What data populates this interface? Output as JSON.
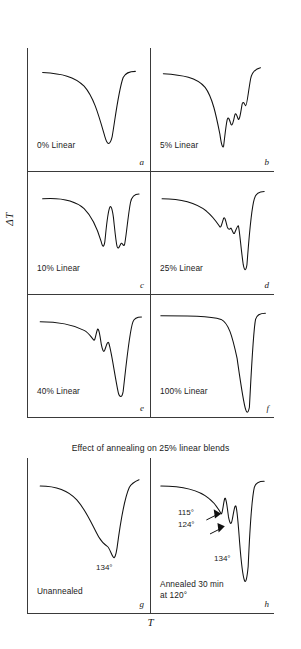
{
  "figure": {
    "y_axis_label": "ΔT",
    "x_axis_label": "T",
    "caption_bottom": "Effect of annealing on 25% linear blends"
  },
  "panels": [
    {
      "id": "a",
      "label": "0% Linear",
      "letter": "a"
    },
    {
      "id": "b",
      "label": "5% Linear",
      "letter": "b"
    },
    {
      "id": "c",
      "label": "10% Linear",
      "letter": "c"
    },
    {
      "id": "d",
      "label": "25% Linear",
      "letter": "d"
    },
    {
      "id": "e",
      "label": "40% Linear",
      "letter": "e"
    },
    {
      "id": "f",
      "label": "100% Linear",
      "letter": "f"
    },
    {
      "id": "g",
      "label": "Unannealed",
      "letter": "g"
    },
    {
      "id": "h",
      "label": "Annealed 30 min\nat 120°",
      "letter": "h"
    }
  ],
  "annotations": {
    "g_peak": "134°",
    "h_peak1": "115°",
    "h_peak2": "124°",
    "h_peak3": "134°"
  },
  "chart_data": {
    "type": "line",
    "xlabel": "T",
    "ylabel": "ΔT",
    "grid": false,
    "legend": "none",
    "note": "Eight thermal-analysis traces. Baseline runs flat at top; endothermic melting peaks deflect downward. Curves are traced paths in panel-local coordinates (0-100 x, 0-100 y, y increasing downward).",
    "series": [
      {
        "name": "0% Linear",
        "panel": "a",
        "peaks": [
          {
            "position": 66,
            "depth": 78,
            "label": null
          }
        ],
        "path": "M 12,20 C 28,21 38,23 46,31 C 54,40 58,55 63,72 C 65,79 67,80 69,72 C 71,61 74,35 78,24 C 80,20 84,19 88,19"
      },
      {
        "name": "5% Linear",
        "panel": "b",
        "peaks": [
          {
            "position": 57,
            "depth": 80,
            "label": null
          },
          {
            "position": 68,
            "depth": 55,
            "label": null
          },
          {
            "position": 76,
            "depth": 45,
            "label": null
          }
        ],
        "path": "M 10,21 C 26,22 37,24 44,32 C 50,40 53,55 56,70 C 57,77 58,82 59,80 C 60,72 61,62 62,58 C 63,55 64,59 65,62 C 66,64 67,60 68,55 C 69,51 70,56 71,58 C 72,59 73,52 74,46 C 75,42 76,46 77,47 C 78,47 79,36 81,25 C 82,20 85,17 89,16"
      },
      {
        "name": "10% Linear",
        "panel": "c",
        "peaks": [
          {
            "position": 61,
            "depth": 62,
            "label": null
          },
          {
            "position": 73,
            "depth": 63,
            "label": null
          }
        ],
        "path": "M 12,22 C 26,21 38,23 46,30 C 53,37 57,47 60,57 C 61,61 62,63 63,57 C 64,48 65,34 67,29 C 68,27 69,30 70,37 C 71,46 72,57 73,61 C 74,64 75,61 76,59 C 77,57 78,61 79,60 C 80,58 82,35 84,25 C 85,20 88,18 91,18"
      },
      {
        "name": "25% Linear",
        "panel": "d",
        "peaks": [
          {
            "position": 57,
            "depth": 46,
            "label": null
          },
          {
            "position": 66,
            "depth": 52,
            "label": null
          },
          {
            "position": 74,
            "depth": 80,
            "label": null
          }
        ],
        "path": "M 9,22 C 24,22 36,25 45,32 C 51,37 54,42 56,45 C 57,46 58,41 59,38 C 60,36 61,41 62,45 C 63,48 64,47 65,46 C 66,47 67,52 68,50 C 69,48 70,44 71,44 C 72,47 73,62 75,76 C 76,81 77,82 78,76 C 79,64 81,32 84,22 C 85,18 88,16 92,16"
      },
      {
        "name": "40% Linear",
        "panel": "e",
        "peaks": [
          {
            "position": 55,
            "depth": 38,
            "label": null
          },
          {
            "position": 62,
            "depth": 48,
            "label": null
          },
          {
            "position": 73,
            "depth": 82,
            "label": null
          }
        ],
        "path": "M 10,22 C 24,22 36,24 46,29 C 50,31 52,35 54,37 C 55,38 56,30 57,28 C 58,27 59,33 60,40 C 61,45 62,48 63,45 C 64,42 65,38 66,39 C 68,43 71,66 74,80 C 75,84 77,85 78,79 C 80,62 83,30 86,22 C 87,19 90,18 93,18"
      },
      {
        "name": "100% Linear",
        "panel": "f",
        "peaks": [
          {
            "position": 72,
            "depth": 95,
            "label": null
          }
        ],
        "path": "M 8,17 C 30,17 48,17 57,20 C 63,23 66,33 70,52 C 72,66 75,88 77,94 C 78,97 79,97 80,92 C 81,74 83,30 85,20 C 86,16 89,15 93,15"
      },
      {
        "name": "Unannealed",
        "panel": "g",
        "peaks": [
          {
            "position": 67,
            "depth": 62,
            "label": "134°"
          }
        ],
        "path": "M 10,18 C 22,18 32,20 40,27 C 48,34 53,44 58,51 C 61,55 63,56 65,57 C 67,58 68,62 70,64 C 71,65 72,63 73,58 C 75,46 79,26 83,19 C 85,16 88,15 91,14"
      },
      {
        "name": "Annealed 30 min at 120°",
        "panel": "h",
        "peaks": [
          {
            "position": 58,
            "depth": 36,
            "label": "115°"
          },
          {
            "position": 64,
            "depth": 44,
            "label": "124°"
          },
          {
            "position": 74,
            "depth": 78,
            "label": "134°"
          }
        ],
        "path": "M 8,18 C 24,18 38,20 47,26 C 52,29 55,33 57,36 C 58,37 59,28 60,26 C 61,25 62,32 63,38 C 64,42 65,44 66,40 C 67,36 68,30 69,31 C 70,33 71,43 72,54 C 73,64 75,77 76,79 C 77,81 78,78 79,70 C 80,52 82,26 84,19 C 85,16 88,15 92,15"
      }
    ]
  }
}
